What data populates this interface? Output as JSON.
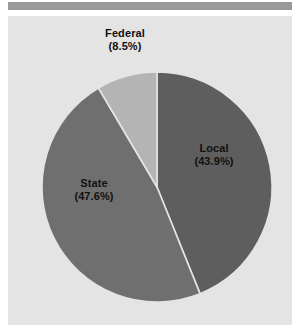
{
  "figure": {
    "background": "#ffffff",
    "panel_background": "#e4e4e4",
    "top_rule_color": "#9a9a9a"
  },
  "chart_data": {
    "type": "pie",
    "title": "",
    "subtitle": "",
    "xlabel": "",
    "ylabel": "",
    "legend": "none",
    "grid": false,
    "start_angle_deg": 0,
    "direction": "clockwise",
    "categories": [
      "Local",
      "State",
      "Federal"
    ],
    "values": [
      43.9,
      47.6,
      8.5
    ],
    "units": "percent",
    "labels": [
      "Local\n(43.9%)",
      "State\n(47.6%)",
      "Federal\n(8.5%)"
    ],
    "colors": [
      "#5e5e5e",
      "#6f6f6f",
      "#b4b4b4"
    ],
    "wedge_edge_color": "#e4e4e4",
    "slices": [
      {
        "name": "Local",
        "value": 43.9,
        "percent_text": "(43.9%)",
        "color": "#5e5e5e",
        "label_placement": "inside"
      },
      {
        "name": "State",
        "value": 47.6,
        "percent_text": "(47.6%)",
        "color": "#6f6f6f",
        "label_placement": "inside"
      },
      {
        "name": "Federal",
        "value": 8.5,
        "percent_text": "(8.5%)",
        "color": "#b4b4b4",
        "label_placement": "outside-top"
      }
    ]
  },
  "labels": {
    "federal": {
      "name": "Federal",
      "percent": "(8.5%)"
    },
    "local": {
      "name": "Local",
      "percent": "(43.9%)"
    },
    "state": {
      "name": "State",
      "percent": "(47.6%)"
    }
  }
}
